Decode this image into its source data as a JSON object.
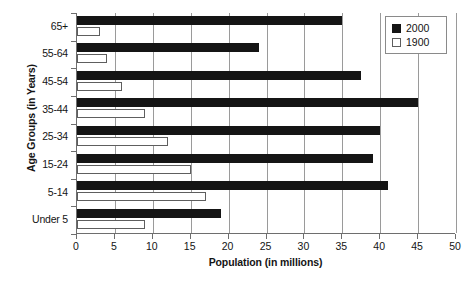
{
  "chart_data": {
    "type": "bar",
    "orientation": "horizontal",
    "title": "",
    "xlabel": "Population (in millions)",
    "ylabel": "Age Groups (in Years)",
    "categories": [
      "65+",
      "55-64",
      "45-54",
      "35-44",
      "25-34",
      "15-24",
      "5-14",
      "Under 5"
    ],
    "series": [
      {
        "name": "2000",
        "color": "#151515",
        "values": [
          35,
          24,
          37.5,
          45,
          40,
          39,
          41,
          19
        ]
      },
      {
        "name": "1900",
        "color": "#ffffff",
        "values": [
          3,
          4,
          6,
          9,
          12,
          15,
          17,
          9
        ]
      }
    ],
    "xlim": [
      0,
      50
    ],
    "xticks": [
      0,
      5,
      10,
      15,
      20,
      25,
      30,
      35,
      40,
      45,
      50
    ],
    "xtick_labels": [
      "0",
      "5",
      "10",
      "15",
      "20",
      "25",
      "30",
      "35",
      "40",
      "45",
      "50"
    ],
    "grid": "vertical",
    "legend_position": "top-right"
  },
  "legend": {
    "entries": [
      {
        "label": "2000",
        "style": "filled"
      },
      {
        "label": "1900",
        "style": "hollow"
      }
    ]
  },
  "caption": {
    "text": ""
  }
}
